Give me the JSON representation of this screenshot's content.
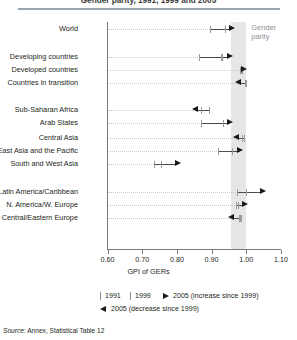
{
  "title": "Gender parity, 1991, 1999 and 2005",
  "band_label_line1": "Gender",
  "band_label_line2": "parity",
  "source_prefix": "Source:",
  "source_text": " Annex, Statistical Table 12",
  "legend": {
    "item_1991": "1991",
    "item_1999": "1999",
    "item_2005_increase": "2005 (increase since 1999)",
    "item_2005_decrease": "2005 (decrease since 1999)"
  },
  "colors": {
    "band": "#e6e6e6",
    "marker": "#1a1a1a",
    "tick": "#9a9a9a",
    "axis": "#7a7a7a",
    "rule": "#9aa6ad"
  },
  "chart_data": {
    "type": "scatter",
    "title": "Gender parity, 1991, 1999 and 2005",
    "xlabel": "GPI of GERs",
    "ylabel": "",
    "xlim": [
      0.6,
      1.1
    ],
    "xticks": [
      0.6,
      0.7,
      0.8,
      0.9,
      1.0,
      1.1
    ],
    "xticklabels": [
      "0.60",
      "0.70",
      "0.80",
      "0.90",
      "1.00",
      "1.10"
    ],
    "grid": false,
    "legend_position": "below",
    "parity_band": [
      0.955,
      1.0
    ],
    "series": [
      {
        "name": "1991",
        "marker": "tick"
      },
      {
        "name": "1999",
        "marker": "tick"
      },
      {
        "name": "2005 (increase since 1999)",
        "marker": "right-arrow"
      },
      {
        "name": "2005 (decrease since 1999)",
        "marker": "left-arrow"
      }
    ],
    "categories": [
      "World",
      "Developing countries",
      "Developed countries",
      "Countries in transition",
      "Sub-Saharan Africa",
      "Arab States",
      "Central Asia",
      "East Asia and the Pacific",
      "South and West Asia",
      "Latin America/Caribbean",
      "N. America/W. Europe",
      "Central/Eastern Europe"
    ],
    "points": [
      {
        "category": "World",
        "v1991": 0.896,
        "v1999": 0.94,
        "v2005": 0.955,
        "direction": "increase"
      },
      {
        "category": "Developing countries",
        "v1991": 0.866,
        "v1999": 0.93,
        "v2005": 0.95,
        "direction": "increase"
      },
      {
        "category": "Developed countries",
        "v1991": 0.985,
        "v1999": 0.988,
        "v2005": 0.99,
        "direction": "increase"
      },
      {
        "category": "Countries in transition",
        "v1991": 1.0,
        "v1999": 0.998,
        "v2005": 0.978,
        "direction": "decrease"
      },
      {
        "category": "Sub-Saharan Africa",
        "v1991": 0.895,
        "v1999": 0.87,
        "v2005": 0.855,
        "direction": "decrease"
      },
      {
        "category": "Arab States",
        "v1991": 0.872,
        "v1999": 0.935,
        "v2005": 0.95,
        "direction": "increase"
      },
      {
        "category": "Central Asia",
        "v1991": 0.995,
        "v1999": 0.99,
        "v2005": 0.972,
        "direction": "decrease"
      },
      {
        "category": "East Asia and the Pacific",
        "v1991": 0.92,
        "v1999": 0.96,
        "v2005": 0.978,
        "direction": "increase"
      },
      {
        "category": "South and West Asia",
        "v1991": 0.735,
        "v1999": 0.755,
        "v2005": 0.8,
        "direction": "increase"
      },
      {
        "category": "Latin America/Caribbean",
        "v1991": 0.975,
        "v1999": 1.0,
        "v2005": 1.045,
        "direction": "increase"
      },
      {
        "category": "N. America/W. Europe",
        "v1991": 0.972,
        "v1999": 0.978,
        "v2005": 0.992,
        "direction": "increase"
      },
      {
        "category": "Central/Eastern Europe",
        "v1991": 0.985,
        "v1999": 0.98,
        "v2005": 0.958,
        "direction": "decrease"
      }
    ]
  }
}
